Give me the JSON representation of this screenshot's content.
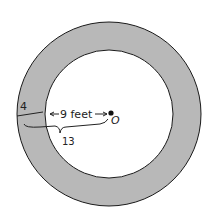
{
  "diagram": {
    "inner_label": "9 feet",
    "center_label": "O",
    "ring_width_annotation": "4",
    "total_annotation": "13",
    "colors": {
      "ring_fill": "#b8b8b8",
      "inner_fill": "#ffffff",
      "stroke": "#1a1a1a"
    }
  }
}
